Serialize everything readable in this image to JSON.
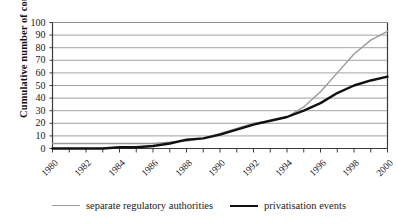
{
  "chart_data": {
    "type": "line",
    "title": "",
    "xlabel": "",
    "ylabel": "Cumulative number of countries",
    "xlim": [
      1980,
      2000
    ],
    "ylim": [
      0,
      100
    ],
    "grid": true,
    "legend_position": "bottom",
    "x": [
      1980,
      1981,
      1982,
      1983,
      1984,
      1985,
      1986,
      1987,
      1988,
      1989,
      1990,
      1991,
      1992,
      1993,
      1994,
      1995,
      1996,
      1997,
      1998,
      1999,
      2000
    ],
    "y_ticks": [
      0,
      10,
      20,
      30,
      40,
      50,
      60,
      70,
      80,
      90,
      100
    ],
    "x_tick_labels": [
      "1980",
      "1982",
      "1984",
      "1986",
      "1988",
      "1990",
      "1992",
      "1994",
      "1996",
      "1998",
      "2000"
    ],
    "x_tick_label_years": [
      1980,
      1982,
      1984,
      1986,
      1988,
      1990,
      1992,
      1994,
      1996,
      1998,
      2000
    ],
    "series": [
      {
        "name": "separate regulatory authorities",
        "color": "#9a9a9a",
        "width": 1.4,
        "values": [
          4,
          4,
          4,
          4,
          4,
          4,
          4,
          5,
          6,
          8,
          12,
          16,
          20,
          22,
          25,
          33,
          45,
          60,
          75,
          86,
          93
        ]
      },
      {
        "name": "privatisation events",
        "color": "#111111",
        "width": 2.4,
        "values": [
          0,
          0,
          0,
          0,
          1,
          1,
          2,
          4,
          7,
          8,
          11,
          15,
          19,
          22,
          25,
          30,
          36,
          44,
          50,
          54,
          57
        ]
      }
    ]
  },
  "legend": {
    "entries": [
      {
        "label": "separate regulatory authorities"
      },
      {
        "label": "privatisation events"
      }
    ]
  },
  "axes": {
    "y_title": "Cumulative number of countries"
  },
  "colors": {
    "grid": "#8c8c8c",
    "axis": "#3b3b3b",
    "series_gray": "#9a9a9a",
    "series_black": "#111111",
    "background": "#ffffff"
  }
}
